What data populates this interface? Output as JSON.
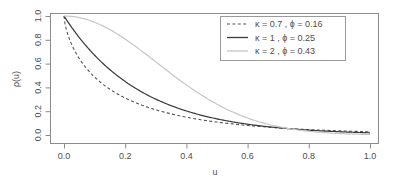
{
  "chart_data": {
    "type": "line",
    "title": "",
    "xlabel": "u",
    "ylabel": "ρ(u)",
    "xlim": [
      0,
      1.0
    ],
    "ylim": [
      0,
      1.0
    ],
    "grid": false,
    "legend_position": "top-right",
    "xticks": [
      "0.0",
      "0.2",
      "0.4",
      "0.6",
      "0.8",
      "1.0"
    ],
    "xtick_values": [
      0.0,
      0.2,
      0.4,
      0.6,
      0.8,
      1.0
    ],
    "yticks": [
      "0.0",
      "0.2",
      "0.4",
      "0.6",
      "0.8",
      "1.0"
    ],
    "ytick_values": [
      0.0,
      0.2,
      0.4,
      0.6,
      0.8,
      1.0
    ],
    "x": [
      0.0,
      0.05,
      0.1,
      0.15,
      0.2,
      0.25,
      0.3,
      0.35,
      0.4,
      0.45,
      0.5,
      0.55,
      0.6,
      0.65,
      0.7,
      0.75,
      0.8,
      0.85,
      0.9,
      0.95,
      1.0
    ],
    "series": [
      {
        "name": "κ = 0.7 , ϕ = 0.16",
        "kappa": 0.7,
        "phi": 0.16,
        "style": "dashed",
        "color": "#555555",
        "values": [
          1.0,
          0.603,
          0.462,
          0.372,
          0.306,
          0.256,
          0.216,
          0.183,
          0.156,
          0.134,
          0.115,
          0.099,
          0.085,
          0.074,
          0.064,
          0.055,
          0.048,
          0.042,
          0.036,
          0.032,
          0.028
        ]
      },
      {
        "name": "κ = 1 , ϕ = 0.25",
        "kappa": 1,
        "phi": 0.25,
        "style": "solid",
        "color": "#3a3a3a",
        "values": [
          1.0,
          0.819,
          0.67,
          0.549,
          0.449,
          0.368,
          0.301,
          0.247,
          0.202,
          0.165,
          0.135,
          0.111,
          0.091,
          0.074,
          0.061,
          0.05,
          0.041,
          0.033,
          0.027,
          0.022,
          0.018
        ]
      },
      {
        "name": "κ = 2 , ϕ = 0.43",
        "kappa": 2,
        "phi": 0.43,
        "style": "solid",
        "color": "#c6c6c6",
        "values": [
          1.0,
          0.987,
          0.948,
          0.886,
          0.805,
          0.713,
          0.613,
          0.513,
          0.417,
          0.331,
          0.255,
          0.192,
          0.141,
          0.101,
          0.07,
          0.047,
          0.031,
          0.02,
          0.012,
          0.007,
          0.004
        ]
      }
    ]
  },
  "legend": {
    "entries": [
      {
        "label": "κ = 0.7 , ϕ = 0.16"
      },
      {
        "label": "κ = 1  ,  ϕ = 0.25"
      },
      {
        "label": "κ = 2  ,  ϕ = 0.43"
      }
    ]
  },
  "axes": {
    "x_title": "u",
    "y_title": "ρ(u)",
    "x_tick_labels": [
      "0.0",
      "0.2",
      "0.4",
      "0.6",
      "0.8",
      "1.0"
    ],
    "y_tick_labels": [
      "0.0",
      "0.2",
      "0.4",
      "0.6",
      "0.8",
      "1.0"
    ]
  },
  "colors": {
    "axis": "#8c8c8c",
    "text": "#4d4d4d",
    "series_1": "#555555",
    "series_2": "#3a3a3a",
    "series_3": "#c6c6c6",
    "background": "#ffffff"
  }
}
